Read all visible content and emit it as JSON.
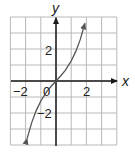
{
  "chart_data": {
    "type": "line",
    "title": "",
    "xlabel": "x",
    "ylabel": "y",
    "xlim": [
      -3,
      4
    ],
    "ylim": [
      -4,
      4
    ],
    "grid": true,
    "grid_step": 1,
    "x_ticks": [
      {
        "value": -2,
        "label": "−2"
      },
      {
        "value": 0,
        "label": "0"
      },
      {
        "value": 2,
        "label": "2"
      }
    ],
    "y_ticks": [
      {
        "value": 2,
        "label": "2"
      },
      {
        "value": -2,
        "label": "−2"
      }
    ],
    "series": [
      {
        "name": "f(x)",
        "description": "odd, increasing cubic-like curve through origin with arrows at both ends",
        "x": [
          -1.9,
          -1.6,
          -1.3,
          -1.0,
          -0.6,
          -0.3,
          0,
          0.3,
          0.6,
          1.0,
          1.3,
          1.6,
          1.9
        ],
        "y": [
          -3.6,
          -2.6,
          -1.85,
          -1.25,
          -0.65,
          -0.31,
          0,
          0.31,
          0.65,
          1.25,
          1.85,
          2.6,
          3.6
        ],
        "arrows": "both"
      }
    ],
    "legend": null
  },
  "labels": {
    "x_axis": "x",
    "y_axis": "y",
    "origin": "0",
    "x_neg2": "−2",
    "x_pos2": "2",
    "y_pos2": "2",
    "y_neg2": "−2"
  },
  "colors": {
    "grid": "#b8b8b8",
    "axis": "#1a1a1a",
    "curve": "#555555",
    "background": "#ffffff"
  }
}
